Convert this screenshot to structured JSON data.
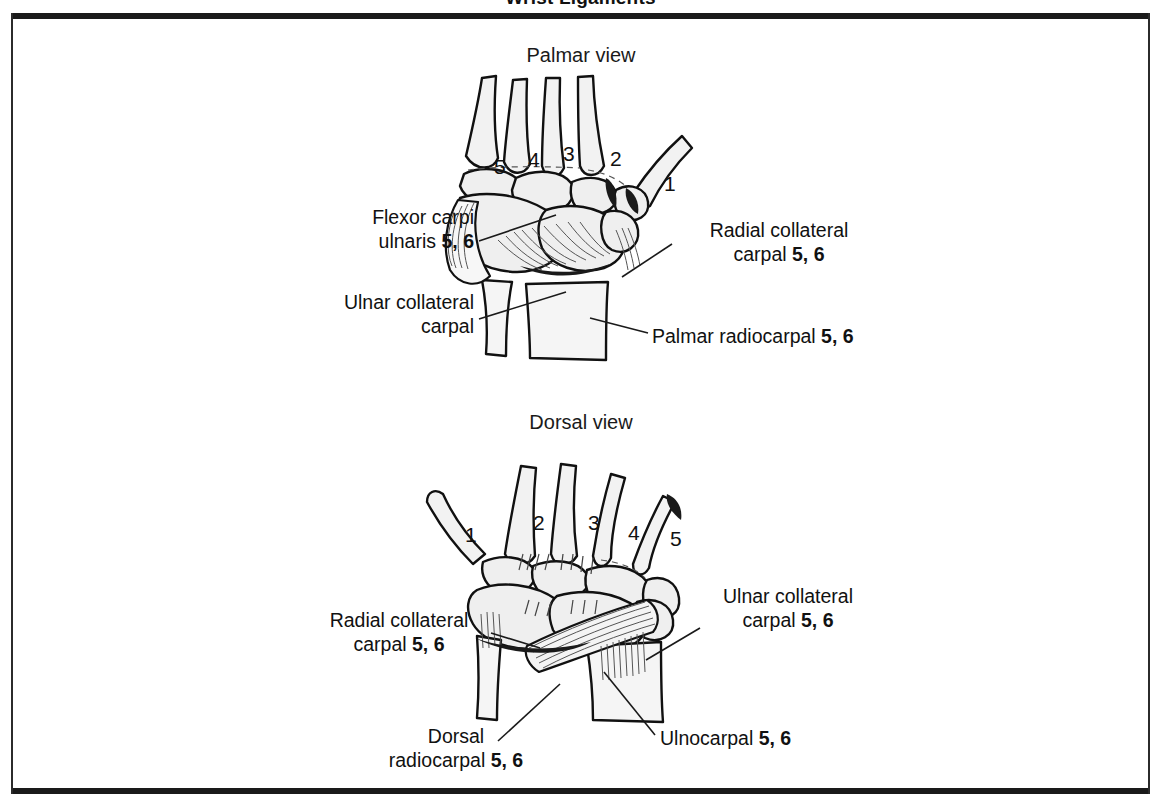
{
  "page": {
    "title": "Wrist Ligaments",
    "background_color": "#ffffff",
    "frame_color": "#1a1a1a"
  },
  "views": [
    {
      "id": "palmar",
      "heading": "Palmar view"
    },
    {
      "id": "dorsal",
      "heading": "Dorsal view"
    }
  ],
  "palmar": {
    "heading": "Palmar view",
    "digits": [
      "5",
      "4",
      "3",
      "2",
      "1"
    ],
    "labels": {
      "flexor_carpi_ulnaris": {
        "text": "Flexor carpi\nulnaris ",
        "line1": "Flexor carpi",
        "line2_text": "ulnaris ",
        "line2_bold": "5, 6"
      },
      "ulnar_collateral_carpal": {
        "line1": "Ulnar collateral",
        "line2_text": "carpal",
        "line2_bold": ""
      },
      "radial_collateral_carpal": {
        "line1": "Radial collateral",
        "line2_text": "carpal ",
        "line2_bold": "5, 6"
      },
      "palmar_radiocarpal": {
        "line1_text": "Palmar radiocarpal ",
        "line1_bold": "5, 6"
      }
    }
  },
  "dorsal": {
    "heading": "Dorsal view",
    "digits": [
      "1",
      "2",
      "3",
      "4",
      "5"
    ],
    "labels": {
      "radial_collateral_carpal": {
        "line1": "Radial collateral",
        "line2_text": "carpal ",
        "line2_bold": "5, 6"
      },
      "ulnar_collateral_carpal": {
        "line1": "Ulnar collateral",
        "line2_text": "carpal ",
        "line2_bold": "5, 6"
      },
      "dorsal_radiocarpal": {
        "line1": "Dorsal",
        "line2_text": "radiocarpal ",
        "line2_bold": "5, 6"
      },
      "ulnocarpal": {
        "line1_text": "Ulnocarpal ",
        "line1_bold": "5, 6"
      }
    }
  }
}
